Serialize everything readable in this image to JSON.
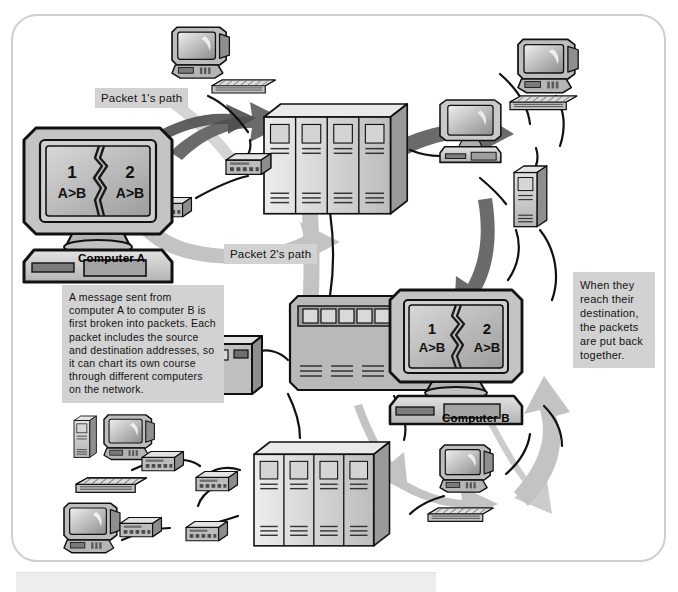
{
  "diagram": {
    "type": "network-packet-routing",
    "frame": {
      "style": "rounded-rectangle-border",
      "border_color": "#cfcfcf"
    },
    "palette": {
      "arrow_dark": "#6b6b6b",
      "arrow_light": "#c3c3c3",
      "label_bg": "#d2d2d2",
      "device_body": "#c9c9c9",
      "device_dark": "#8f8f8f",
      "device_light": "#e6e6e6",
      "outline": "#111111",
      "page_bg": "#ffffff"
    }
  },
  "labels": {
    "packet1_path": "Packet 1's path",
    "packet2_path": "Packet 2's path",
    "note_main": "A message sent from computer A to computer B is first broken into packets. Each packet includes the source and destination addresses, so it can chart its own course through different computers on the network.",
    "note_reassembly": "When they reach their destination, the packets are put back together."
  },
  "devices": {
    "computer_a": {
      "caption": "Computer A",
      "screen": {
        "packet_left_number": "1",
        "packet_left_addr": "A>B",
        "packet_right_number": "2",
        "packet_right_addr": "A>B",
        "split": "torn-jagged-divider"
      }
    },
    "computer_b": {
      "caption": "Computer B",
      "screen": {
        "packet_left_number": "1",
        "packet_left_addr": "A>B",
        "packet_right_number": "2",
        "packet_right_addr": "A>B",
        "split": "torn-jagged-divider"
      }
    },
    "nodes": [
      {
        "name": "top-center-workstation",
        "kind": "desktop-computer-with-keyboard"
      },
      {
        "name": "top-right-monitor",
        "kind": "crt-monitor"
      },
      {
        "name": "top-right-workstation",
        "kind": "desktop-computer-with-keyboard"
      },
      {
        "name": "upper-server-rack",
        "kind": "server-rack",
        "units": 4
      },
      {
        "name": "mid-right-workstation",
        "kind": "desktop-computer"
      },
      {
        "name": "right-server-tower",
        "kind": "server-tower"
      },
      {
        "name": "center-hub",
        "kind": "mainframe-hub"
      },
      {
        "name": "center-small-box",
        "kind": "network-box"
      },
      {
        "name": "lower-server-rack",
        "kind": "server-rack",
        "units": 4
      },
      {
        "name": "bottom-right-workstation",
        "kind": "desktop-computer-with-keyboard"
      },
      {
        "name": "bottom-left-workstation",
        "kind": "desktop-computer-with-tower-and-keyboard"
      },
      {
        "name": "bottom-left-monitor",
        "kind": "crt-monitor"
      },
      {
        "name": "router-a1",
        "kind": "router-modem"
      },
      {
        "name": "router-a2",
        "kind": "router-modem"
      },
      {
        "name": "router-rack",
        "kind": "router-modem"
      },
      {
        "name": "router-bl1",
        "kind": "router-modem"
      },
      {
        "name": "router-bl2",
        "kind": "router-modem"
      },
      {
        "name": "router-bl3",
        "kind": "router-modem"
      },
      {
        "name": "router-bl4",
        "kind": "router-modem"
      }
    ]
  },
  "paths": {
    "packet1": {
      "shade": "dark",
      "description": "Computer A -> upper server rack -> mid-right workstation -> Computer B"
    },
    "packet2": {
      "shade": "light",
      "description": "Computer A -> center hub -> lower server rack -> bottom-right workstation -> Computer B"
    }
  }
}
